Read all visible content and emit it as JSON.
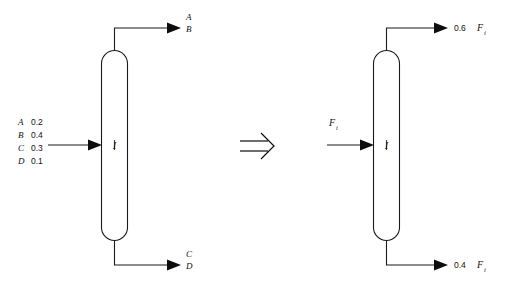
{
  "figure": {
    "background_color": "#ffffff",
    "line_color": "#1a1a1a",
    "text_color": "#111111",
    "relation_symbol": "implies-double-arrow"
  },
  "left_diagram": {
    "name": "multicomponent-column",
    "unit_label": "I",
    "feed": {
      "label_lines": [
        {
          "component": "A",
          "fraction": "0.2"
        },
        {
          "component": "B",
          "fraction": "0.4"
        },
        {
          "component": "C",
          "fraction": "0.3"
        },
        {
          "component": "D",
          "fraction": "0.1"
        }
      ]
    },
    "top_product": {
      "lines": [
        "A",
        "B"
      ]
    },
    "bottom_product": {
      "lines": [
        "C",
        "D"
      ]
    }
  },
  "right_diagram": {
    "name": "pseudo-binary-column",
    "unit_label": "I",
    "feed": {
      "symbol": "F",
      "subscript": "i"
    },
    "top_product": {
      "value": "0.6",
      "symbol": "F",
      "subscript": "i"
    },
    "bottom_product": {
      "value": "0.4",
      "symbol": "F",
      "subscript": "i"
    }
  }
}
